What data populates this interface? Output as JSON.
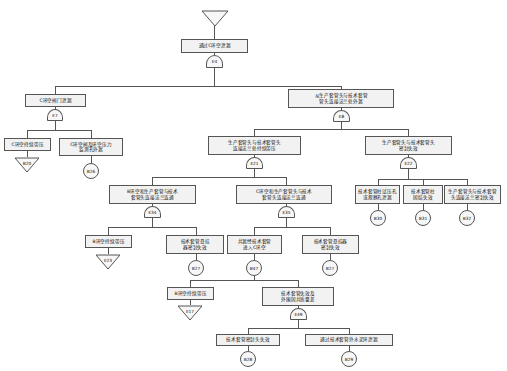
{
  "diagram": {
    "type": "fault-tree"
  },
  "top_transfer": {
    "label": ""
  },
  "events": {
    "e4_box": {
      "text": "通过C环空泄漏"
    },
    "e7_box": {
      "text": "C环空阀门泄漏"
    },
    "e8_box": {
      "text": "从生产套管头与技术套管\n管头连接法兰处外漏"
    },
    "b20_box": {
      "text": "C环空持续带压"
    },
    "b26_box": {
      "text": "C环空阀及环空压力\n监测孔外漏"
    },
    "e21_box": {
      "text": "生产套管头与技术套管头\n连接法兰处持续带压"
    },
    "e22_box": {
      "text": "生产套管头与技术套管头\n密封失效"
    },
    "e34_box": {
      "text": "B环空和生产套管与技术\n套管头连接法兰连通"
    },
    "e35_box": {
      "text": "C环空和生产套管头与技术\n套管头连接法兰连通"
    },
    "b30_box": {
      "text": "技术套管柱试压孔\n或观察孔泄漏"
    },
    "b31_box": {
      "text": "技术套管柱\n固结失效"
    },
    "b32_box": {
      "text": "生产套管头与技术套管\n头连接法兰密封失效"
    },
    "e23_box": {
      "text": "B环空持续带压"
    },
    "b27a_box": {
      "text": "技术套管悬挂\n器密封失效"
    },
    "b47_box": {
      "text": "井漏经技术套管\n进入C环空"
    },
    "b27b_box": {
      "text": "技术套管悬挂器\n密封失效"
    },
    "e17_box": {
      "text": "B环空持续带压"
    },
    "e49_box": {
      "text": "技术套管失效及\n外围固井质量差"
    },
    "b28_box": {
      "text": "技术套管密封头失效"
    },
    "b29_box": {
      "text": "通过技术套管外水泥环泄漏"
    }
  },
  "gates": {
    "e4": {
      "label": "E4"
    },
    "e7": {
      "label": "E7"
    },
    "e8": {
      "label": "E8"
    },
    "b26": {
      "label": "B26"
    },
    "e21": {
      "label": "E21"
    },
    "e22": {
      "label": "E22"
    },
    "e34": {
      "label": "E34"
    },
    "e35": {
      "label": "E35"
    },
    "b27a": {
      "label": "B27"
    },
    "b47": {
      "label": "B47"
    },
    "b27b": {
      "label": "B27"
    },
    "e49": {
      "label": "E49"
    }
  },
  "transfers": {
    "top": {
      "label": ""
    },
    "b20": {
      "label": "B20"
    },
    "e23": {
      "label": "E23"
    },
    "e17": {
      "label": "E17"
    }
  },
  "basic_events": {
    "b30": {
      "label": "B30"
    },
    "b31": {
      "label": "B31"
    },
    "b32": {
      "label": "B32"
    },
    "b28": {
      "label": "B28"
    },
    "b29": {
      "label": "B29"
    }
  },
  "colors": {
    "stroke": "#555555",
    "box_fill": "#f2f2f2",
    "text": "#111111",
    "background": "#ffffff"
  }
}
